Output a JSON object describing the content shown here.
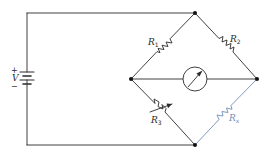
{
  "diagram": {
    "type": "Wheatstone bridge circuit",
    "colors": {
      "wire": "#2a2a2a",
      "unknown_resistor": "#6f8fb8",
      "background": "#ffffff"
    },
    "source": {
      "label": "V",
      "plus": "+",
      "minus": "−"
    },
    "resistors": [
      {
        "id": "R1",
        "base": "R",
        "sub": "1"
      },
      {
        "id": "R2",
        "base": "R",
        "sub": "2"
      },
      {
        "id": "R3",
        "base": "R",
        "sub": "3",
        "variable": true
      },
      {
        "id": "Rx",
        "base": "R",
        "sub": "x",
        "highlighted": true
      }
    ],
    "meter": {
      "name": "galvanometer"
    }
  }
}
